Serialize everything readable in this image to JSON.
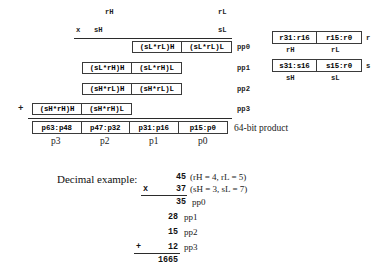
{
  "figure": {
    "operand_labels": {
      "rH": "rH",
      "rL": "rL",
      "sH": "sH",
      "sL": "sL",
      "multiply_sign": "x",
      "plus_sign": "+"
    },
    "partial_products": [
      {
        "id": "pp0",
        "label": "pp0",
        "cells": [
          "(sL*rL)H",
          "(sL*rL)L"
        ]
      },
      {
        "id": "pp1",
        "label": "pp1",
        "cells": [
          "(sL*rH)H",
          "(sL*rH)L"
        ]
      },
      {
        "id": "pp2",
        "label": "pp2",
        "cells": [
          "(sH*rL)H",
          "(sH*rL)L"
        ]
      },
      {
        "id": "pp3",
        "label": "pp3",
        "cells": [
          "(sH*rH)H",
          "(sH*rH)L"
        ]
      }
    ],
    "product": {
      "label": "64-bit product",
      "cells": [
        "p63:p48",
        "p47:p32",
        "p31:p16",
        "p15:p0"
      ],
      "sublabels": [
        "p3",
        "p2",
        "p1",
        "p0"
      ]
    },
    "registers": [
      {
        "name": "r",
        "cells": [
          "r31:r16",
          "r15:r0"
        ],
        "sublabels": [
          "rH",
          "rL"
        ]
      },
      {
        "name": "s",
        "cells": [
          "s31:s16",
          "s15:r0"
        ],
        "sublabels": [
          "sH",
          "sL"
        ]
      }
    ]
  },
  "decimal_example": {
    "title": "Decimal example:",
    "multiplicand": "45",
    "multiplicand_note": "(rH = 4, rL = 5)",
    "multiplier_sign": "x",
    "multiplier": "37",
    "multiplier_note": "(sH = 3, sL = 7)",
    "rows": [
      {
        "value": "35",
        "label": "pp0",
        "sign": ""
      },
      {
        "value": "28",
        "label": "pp1",
        "sign": ""
      },
      {
        "value": "15",
        "label": "pp2",
        "sign": ""
      },
      {
        "value": "12",
        "label": "pp3",
        "sign": "+"
      }
    ],
    "total": "1665"
  }
}
